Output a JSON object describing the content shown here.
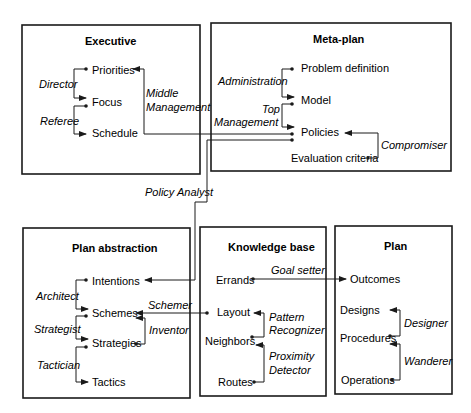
{
  "diagram": {
    "boxes": [
      {
        "id": "executive",
        "title": "Executive",
        "nodes": [
          "Priorities",
          "Focus",
          "Schedule"
        ],
        "roles": [
          "Director",
          "Referee",
          "Middle Management"
        ]
      },
      {
        "id": "meta_plan",
        "title": "Meta-plan",
        "nodes": [
          "Problem definition",
          "Model",
          "Policies",
          "Evaluation criteria"
        ],
        "roles": [
          "Administration",
          "Top Management",
          "Compromiser"
        ]
      },
      {
        "id": "plan_abstraction",
        "title": "Plan abstraction",
        "nodes": [
          "Intentions",
          "Schemes",
          "Strategies",
          "Tactics"
        ],
        "roles": [
          "Architect",
          "Strategist",
          "Tactician",
          "Inventor",
          "Schemer"
        ]
      },
      {
        "id": "knowledge_base",
        "title": "Knowledge base",
        "nodes": [
          "Errands",
          "Layout",
          "Neighbors",
          "Routes"
        ],
        "roles": [
          "Goal setter",
          "Pattern Recognizer",
          "Proximity Detector"
        ]
      },
      {
        "id": "plan",
        "title": "Plan",
        "nodes": [
          "Outcomes",
          "Designs",
          "Procedures",
          "Operations"
        ],
        "roles": [
          "Designer",
          "Wanderer"
        ]
      }
    ],
    "cross_links": [
      {
        "from": "Policies",
        "to": "Priorities",
        "label": "Middle Management"
      },
      {
        "from": "Policies",
        "to": "Intentions",
        "label": "Policy Analyst"
      },
      {
        "from": "Layout",
        "to": "Schemes",
        "label": "Schemer"
      },
      {
        "from": "Errands",
        "to": "Outcomes",
        "label": "Goal setter"
      }
    ]
  },
  "labels": {
    "executive": {
      "title": "Executive",
      "priorities": "Priorities",
      "focus": "Focus",
      "schedule": "Schedule",
      "director": "Director",
      "referee": "Referee",
      "middle1": "Middle",
      "middle2": "Management"
    },
    "meta": {
      "title": "Meta-plan",
      "problem": "Problem definition",
      "model": "Model",
      "policies": "Policies",
      "evaluation": "Evaluation criteria",
      "administration": "Administration",
      "top1": "Top",
      "top2": "Management",
      "compromiser": "Compromiser"
    },
    "policy_analyst": "Policy Analyst",
    "pa": {
      "title": "Plan abstraction",
      "intentions": "Intentions",
      "schemes": "Schemes",
      "strategies": "Strategies",
      "tactics": "Tactics",
      "architect": "Architect",
      "strategist": "Strategist",
      "tactician": "Tactician",
      "inventor": "Inventor",
      "schemer": "Schemer"
    },
    "kb": {
      "title": "Knowledge base",
      "errands": "Errands",
      "layout": "Layout",
      "neighbors": "Neighbors",
      "routes": "Routes",
      "goal_setter": "Goal setter",
      "pattern1": "Pattern",
      "pattern2": "Recognizer",
      "proximity1": "Proximity",
      "proximity2": "Detector"
    },
    "plan": {
      "title": "Plan",
      "outcomes": "Outcomes",
      "designs": "Designs",
      "procedures": "Procedures",
      "operations": "Operations",
      "designer": "Designer",
      "wanderer": "Wanderer"
    }
  }
}
